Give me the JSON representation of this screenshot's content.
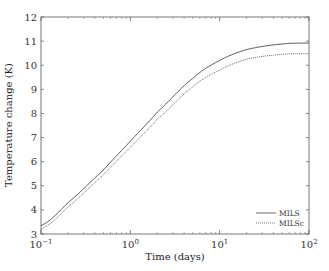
{
  "chart_data": {
    "type": "line",
    "title": "",
    "xlabel": "Time (days)",
    "ylabel": "Temperature change (K)",
    "xscale": "log",
    "xlim": [
      0.1,
      100
    ],
    "ylim": [
      3,
      12
    ],
    "x_ticks": [
      {
        "base": "10",
        "exp": "−1",
        "value": 0.1
      },
      {
        "base": "10",
        "exp": "0",
        "value": 1
      },
      {
        "base": "10",
        "exp": "1",
        "value": 10
      },
      {
        "base": "10",
        "exp": "2",
        "value": 100
      }
    ],
    "y_ticks": [
      "3",
      "4",
      "5",
      "6",
      "7",
      "8",
      "9",
      "10",
      "11",
      "12"
    ],
    "grid": false,
    "legend_position": "bottom-right",
    "x": [
      0.1,
      0.2,
      0.5,
      1,
      2,
      5,
      10,
      20,
      50,
      100
    ],
    "series": [
      {
        "name": "MILS",
        "style": "solid",
        "values": [
          3.35,
          4.3,
          5.65,
          6.85,
          8.05,
          9.45,
          10.2,
          10.65,
          10.88,
          10.92
        ]
      },
      {
        "name": "MILSc",
        "style": "dotted",
        "values": [
          3.2,
          4.12,
          5.45,
          6.6,
          7.75,
          9.1,
          9.8,
          10.25,
          10.45,
          10.48
        ]
      }
    ]
  }
}
